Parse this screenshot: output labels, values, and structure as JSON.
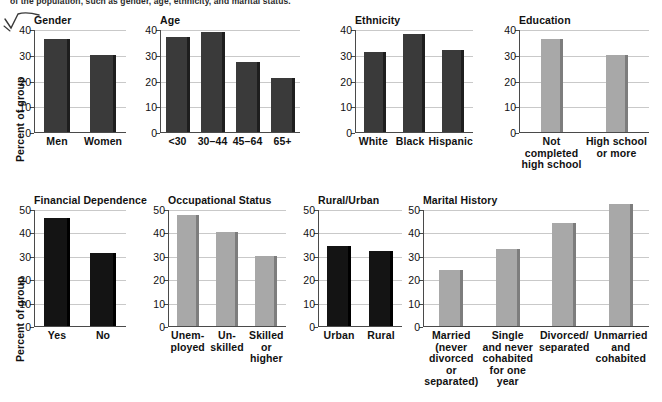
{
  "page": {
    "clipped_caption": "of the population, such as gender, age, ethnicity, and marital status.",
    "doodle_icon": "check-scribble-icon",
    "y_axis_label": "Percent of group",
    "colors": {
      "bar_dark": "#3a3a3a",
      "bar_black": "#141414",
      "bar_light": "#a8a8a8",
      "bar_side_dark": "#1e1e1e",
      "bar_side_black": "#000000",
      "bar_side_light": "#7d7d7d",
      "gridline": "#c9c9c9",
      "axis": "#4a4a4a",
      "text": "#111111"
    }
  },
  "chart_data": [
    {
      "id": "gender",
      "type": "bar",
      "title": "Gender",
      "xlabel": "",
      "ylabel": "Percent of group",
      "ylim": [
        0,
        40
      ],
      "yticks": [
        0,
        10,
        20,
        30,
        40
      ],
      "grid": true,
      "bar_style": "dark",
      "categories": [
        "Men",
        "Women"
      ],
      "category_lines": [
        [
          "Men"
        ],
        [
          "Women"
        ]
      ],
      "values": [
        36,
        30
      ]
    },
    {
      "id": "age",
      "type": "bar",
      "title": "Age",
      "xlabel": "",
      "ylabel": "Percent of group",
      "ylim": [
        0,
        40
      ],
      "yticks": [
        0,
        10,
        20,
        30,
        40
      ],
      "grid": true,
      "bar_style": "dark",
      "categories": [
        "<30",
        "30–44",
        "45–64",
        "65+"
      ],
      "category_lines": [
        [
          "<30"
        ],
        [
          "30–44"
        ],
        [
          "45–64"
        ],
        [
          "65+"
        ]
      ],
      "values": [
        37,
        39,
        27,
        21
      ]
    },
    {
      "id": "ethnicity",
      "type": "bar",
      "title": "Ethnicity",
      "xlabel": "",
      "ylabel": "Percent of group",
      "ylim": [
        0,
        40
      ],
      "yticks": [
        0,
        10,
        20,
        30,
        40
      ],
      "grid": true,
      "bar_style": "dark",
      "categories": [
        "White",
        "Black",
        "Hispanic"
      ],
      "category_lines": [
        [
          "White"
        ],
        [
          "Black"
        ],
        [
          "Hispanic"
        ]
      ],
      "values": [
        31,
        38,
        32
      ]
    },
    {
      "id": "education",
      "type": "bar",
      "title": "Education",
      "xlabel": "",
      "ylabel": "Percent of group",
      "ylim": [
        0,
        40
      ],
      "yticks": [
        0,
        10,
        20,
        30,
        40
      ],
      "grid": true,
      "bar_style": "light",
      "categories": [
        "Not completed high school",
        "High school or more"
      ],
      "category_lines": [
        [
          "Not completed",
          "high school"
        ],
        [
          "High school",
          "or more"
        ]
      ],
      "values": [
        36,
        30
      ]
    },
    {
      "id": "financial-dependence",
      "type": "bar",
      "title": "Financial Dependence",
      "xlabel": "",
      "ylabel": "Percent of group",
      "ylim": [
        0,
        50
      ],
      "yticks": [
        0,
        10,
        20,
        30,
        40,
        50
      ],
      "grid": true,
      "bar_style": "black",
      "categories": [
        "Yes",
        "No"
      ],
      "category_lines": [
        [
          "Yes"
        ],
        [
          "No"
        ]
      ],
      "values": [
        46,
        31
      ]
    },
    {
      "id": "occupational-status",
      "type": "bar",
      "title": "Occupational Status",
      "xlabel": "",
      "ylabel": "Percent of group",
      "ylim": [
        0,
        50
      ],
      "yticks": [
        0,
        10,
        20,
        30,
        40,
        50
      ],
      "grid": true,
      "bar_style": "light",
      "categories": [
        "Unemployed",
        "Un-skilled",
        "Skilled or higher"
      ],
      "category_lines": [
        [
          "Unem-",
          "ployed"
        ],
        [
          "Un-",
          "skilled"
        ],
        [
          "Skilled",
          "or",
          "higher"
        ]
      ],
      "values": [
        47.5,
        40,
        30
      ]
    },
    {
      "id": "rural-urban",
      "type": "bar",
      "title": "Rural/Urban",
      "xlabel": "",
      "ylabel": "Percent of group",
      "ylim": [
        0,
        50
      ],
      "yticks": [
        0,
        10,
        20,
        30,
        40,
        50
      ],
      "grid": true,
      "bar_style": "black",
      "categories": [
        "Urban",
        "Rural"
      ],
      "category_lines": [
        [
          "Urban"
        ],
        [
          "Rural"
        ]
      ],
      "values": [
        34,
        32
      ]
    },
    {
      "id": "marital-history",
      "type": "bar",
      "title": "Marital History",
      "xlabel": "",
      "ylabel": "Percent of group",
      "ylim": [
        0,
        50
      ],
      "yticks": [
        0,
        10,
        20,
        30,
        40,
        50
      ],
      "grid": true,
      "bar_style": "light",
      "categories": [
        "Married (never divorced or separated)",
        "Single and never cohabited for one year",
        "Divorced/separated",
        "Unmarried and cohabited"
      ],
      "category_lines": [
        [
          "Married",
          "(never",
          "divorced or",
          "separated)"
        ],
        [
          "Single",
          "and never",
          "cohabited",
          "for one year"
        ],
        [
          "Divorced/",
          "separated"
        ],
        [
          "Unmarried",
          "and",
          "cohabited"
        ]
      ],
      "values": [
        24,
        33,
        44,
        52
      ]
    }
  ],
  "layout": {
    "row1": [
      {
        "id": "gender",
        "left": 34,
        "plot_w": 92,
        "plot_h": 103,
        "bar_w": 26
      },
      {
        "id": "age",
        "left": 160,
        "plot_w": 140,
        "plot_h": 103,
        "bar_w": 24
      },
      {
        "id": "ethnicity",
        "left": 355,
        "plot_w": 118,
        "plot_h": 103,
        "bar_w": 22
      },
      {
        "id": "education",
        "left": 519,
        "plot_w": 130,
        "plot_h": 103,
        "bar_w": 22
      }
    ],
    "row2": [
      {
        "id": "financial-dependence",
        "left": 34,
        "plot_w": 92,
        "plot_h": 117,
        "bar_w": 26
      },
      {
        "id": "occupational-status",
        "left": 168,
        "plot_w": 118,
        "plot_h": 117,
        "bar_w": 22
      },
      {
        "id": "rural-urban",
        "left": 318,
        "plot_w": 84,
        "plot_h": 117,
        "bar_w": 24
      },
      {
        "id": "marital-history",
        "left": 423,
        "plot_w": 226,
        "plot_h": 117,
        "bar_w": 24
      }
    ]
  }
}
